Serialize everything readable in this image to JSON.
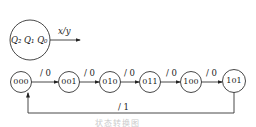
{
  "legend": {
    "state_label": "Q₂ Q₁ Q₀",
    "arrow_label": "x/y"
  },
  "states": [
    {
      "name": "000",
      "x": 21
    },
    {
      "name": "001",
      "x": 69
    },
    {
      "name": "010",
      "x": 110
    },
    {
      "name": "011",
      "x": 150
    },
    {
      "name": "100",
      "x": 191
    },
    {
      "name": "101",
      "x": 234
    }
  ],
  "transitions": [
    {
      "from": "000",
      "to": "001",
      "label": "/ 0"
    },
    {
      "from": "001",
      "to": "010",
      "label": "/ 0"
    },
    {
      "from": "010",
      "to": "011",
      "label": "/ 0"
    },
    {
      "from": "011",
      "to": "100",
      "label": "/ 0"
    },
    {
      "from": "100",
      "to": "101",
      "label": "/ 0"
    },
    {
      "from": "101",
      "to": "000",
      "label": "/ 1"
    }
  ],
  "caption": "状态转换图"
}
